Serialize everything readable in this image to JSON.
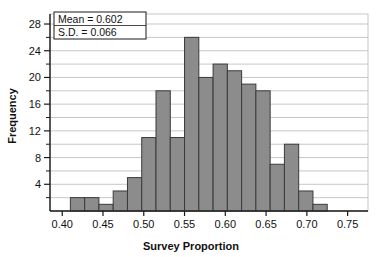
{
  "chart_data": {
    "type": "bar",
    "title": "",
    "xlabel": "Survey Proportion",
    "ylabel": "Frequency",
    "xlim": [
      0.385,
      0.775
    ],
    "ylim": [
      0,
      29.5
    ],
    "grid": true,
    "legend": "none",
    "bin_width": 0.0175,
    "bin_starts": [
      0.41,
      0.4275,
      0.445,
      0.4625,
      0.48,
      0.4975,
      0.515,
      0.5325,
      0.55,
      0.5675,
      0.585,
      0.6025,
      0.62,
      0.6375,
      0.655,
      0.6725,
      0.69,
      0.7075,
      0.725,
      0.7425
    ],
    "categories": [
      "0.410-0.428",
      "0.428-0.445",
      "0.445-0.463",
      "0.463-0.480",
      "0.480-0.498",
      "0.498-0.515",
      "0.515-0.533",
      "0.533-0.550",
      "0.550-0.568",
      "0.568-0.585",
      "0.585-0.603",
      "0.603-0.620",
      "0.620-0.638",
      "0.638-0.655",
      "0.655-0.673",
      "0.673-0.690",
      "0.690-0.708",
      "0.708-0.725",
      "0.725-0.743",
      "0.743-0.760"
    ],
    "values": [
      2,
      2,
      1,
      3,
      5,
      11,
      18,
      11,
      26,
      20,
      22,
      21,
      19,
      18,
      7,
      10,
      3,
      1,
      0,
      0
    ],
    "xticks": [
      0.4,
      0.45,
      0.5,
      0.55,
      0.6,
      0.65,
      0.7,
      0.75
    ],
    "xtick_labels": [
      "0.40",
      "0.45",
      "0.50",
      "0.55",
      "0.60",
      "0.65",
      "0.70",
      "0.75"
    ],
    "yticks": [
      4,
      8,
      12,
      16,
      20,
      24,
      28
    ],
    "ytick_labels": [
      "4",
      "8",
      "12",
      "16",
      "20",
      "24",
      "28"
    ],
    "y_minor_ticks": [
      2,
      6,
      10,
      14,
      18,
      22,
      26
    ],
    "annotations": [
      {
        "label": "Mean = 0.602"
      },
      {
        "label": "S.D. = 0.066"
      }
    ],
    "colors": {
      "bar_fill": "#8c8c8c",
      "bar_edge": "#3a3a3a",
      "grid": "#b9b9b9",
      "axis": "#1a1a1a",
      "background": "#ffffff",
      "text": "#111111"
    }
  }
}
